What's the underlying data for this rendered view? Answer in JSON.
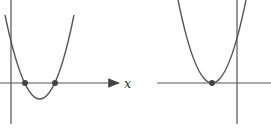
{
  "figures": [
    {
      "name": "left-graph",
      "description": "Upward parabola crossing the x-axis at two points",
      "x_axis_label": "x",
      "roots_marked": 2,
      "vertex_below_axis": true
    },
    {
      "name": "right-graph",
      "description": "Upward parabola touching the x-axis at one point (double root)",
      "roots_marked": 1,
      "vertex_on_axis": true
    }
  ],
  "colors": {
    "curve": "#555555",
    "axis": "#555555",
    "point": "#444444"
  }
}
